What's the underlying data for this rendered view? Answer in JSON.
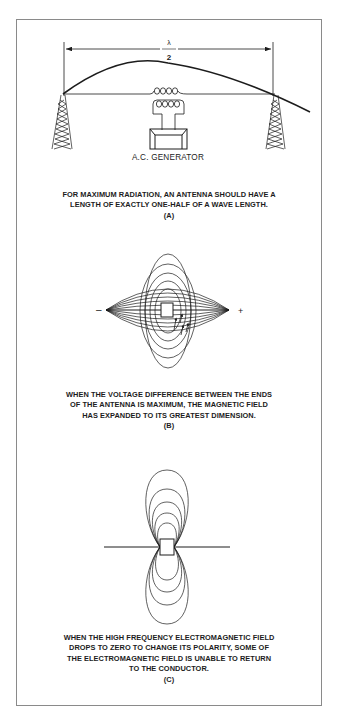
{
  "figure": {
    "panel_a": {
      "dimension_label_numerator": "λ",
      "dimension_label_denominator": "2",
      "generator_label": "A.C. GENERATOR",
      "caption_lines": [
        "FOR MAXIMUM RADIATION, AN ANTENNA SHOULD HAVE A",
        "LENGTH OF EXACTLY ONE-HALF OF A WAVE LENGTH."
      ],
      "id": "(A)"
    },
    "panel_b": {
      "negative_label": "–",
      "positive_label": "+",
      "caption_lines": [
        "WHEN THE VOLTAGE DIFFERENCE BETWEEN THE ENDS",
        "OF THE ANTENNA IS MAXIMUM, THE MAGNETIC FIELD",
        "HAS EXPANDED TO ITS GREATEST DIMENSION."
      ],
      "id": "(B)"
    },
    "panel_c": {
      "caption_lines": [
        "WHEN THE HIGH FREQUENCY ELECTROMAGNETIC FIELD",
        "DROPS TO ZERO TO CHANGE ITS POLARITY, SOME OF",
        "THE ELECTROMAGNETIC FIELD IS UNABLE TO RETURN",
        "TO THE CONDUCTOR."
      ],
      "id": "(C)"
    },
    "colors": {
      "line": "#1c1c1c",
      "frame": "#8a8a8a",
      "background": "#ffffff"
    }
  }
}
